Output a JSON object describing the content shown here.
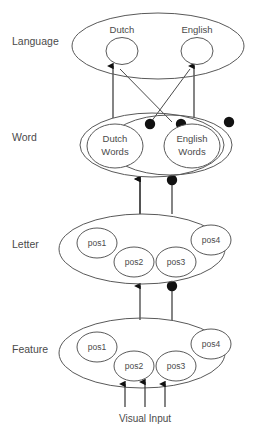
{
  "diagram": {
    "background_color": "#ffffff",
    "stroke_color": "#595959",
    "text_color": "#4a4a4a",
    "dot_color": "#111111",
    "layers": [
      {
        "id": "language",
        "label": "Language",
        "nodes": [
          {
            "id": "dutch",
            "label": "Dutch"
          },
          {
            "id": "english",
            "label": "English"
          }
        ]
      },
      {
        "id": "word",
        "label": "Word",
        "nodes": [
          {
            "id": "dutch-words",
            "label_line1": "Dutch",
            "label_line2": "Words"
          },
          {
            "id": "english-words",
            "label_line1": "English",
            "label_line2": "Words"
          }
        ]
      },
      {
        "id": "letter",
        "label": "Letter",
        "nodes": [
          {
            "id": "letter-pos1",
            "label": "pos1"
          },
          {
            "id": "letter-pos2",
            "label": "pos2"
          },
          {
            "id": "letter-pos3",
            "label": "pos3"
          },
          {
            "id": "letter-pos4",
            "label": "pos4"
          }
        ]
      },
      {
        "id": "feature",
        "label": "Feature",
        "nodes": [
          {
            "id": "feature-pos1",
            "label": "pos1"
          },
          {
            "id": "feature-pos2",
            "label": "pos2"
          },
          {
            "id": "feature-pos3",
            "label": "pos3"
          },
          {
            "id": "feature-pos4",
            "label": "pos4"
          }
        ]
      }
    ],
    "input": {
      "label": "Visual Input",
      "arrow_count": 3
    }
  }
}
